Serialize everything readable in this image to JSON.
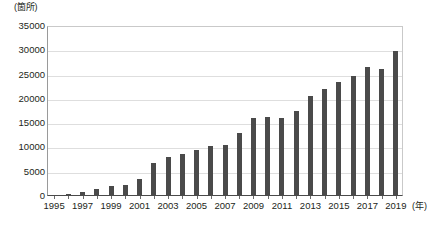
{
  "chart_data": {
    "type": "bar",
    "title": "",
    "subtitle": "",
    "xlabel": "(年)",
    "ylabel": "(箇所)",
    "ylim": [
      0,
      35000
    ],
    "ytick_labels": [
      "35000",
      "30000",
      "25000",
      "20000",
      "15000",
      "10000",
      "5000",
      "0"
    ],
    "ytick_values": [
      35000,
      30000,
      25000,
      20000,
      15000,
      10000,
      5000,
      0
    ],
    "grid": true,
    "legend": "none",
    "categories": [
      "1995",
      "1996",
      "1997",
      "1998",
      "1999",
      "2000",
      "2001",
      "2002",
      "2003",
      "2004",
      "2005",
      "2006",
      "2007",
      "2008",
      "2009",
      "2010",
      "2011",
      "2012",
      "2013",
      "2014",
      "2015",
      "2016",
      "2017",
      "2018",
      "2019"
    ],
    "xtick_labels_shown": [
      "1995",
      "1997",
      "1999",
      "2001",
      "2003",
      "2005",
      "2007",
      "2009",
      "2011",
      "2013",
      "2015",
      "2017",
      "2019"
    ],
    "values": [
      200,
      400,
      900,
      1400,
      2000,
      2200,
      3500,
      6800,
      8000,
      8700,
      9500,
      10200,
      10500,
      13000,
      16000,
      16200,
      16000,
      17500,
      20500,
      22000,
      23500,
      24800,
      26500,
      26200,
      29800
    ],
    "bar_color": "#4a4a4a",
    "grid_color": "#dedede",
    "axis_color": "#4a4a4a",
    "background_color": "#ffffff"
  }
}
